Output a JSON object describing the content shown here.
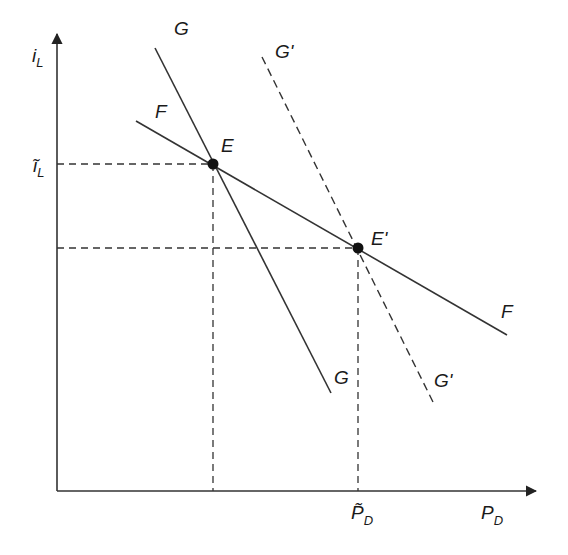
{
  "diagram": {
    "type": "economics-curve-diagram",
    "axes": {
      "y_label": "i",
      "y_label_sub": "L",
      "x_label": "P",
      "x_label_sub": "D",
      "y_tick_label": "ĩ",
      "y_tick_label_sub": "L",
      "x_tick_label": "P̃",
      "x_tick_label_sub": "D"
    },
    "curves": [
      {
        "id": "F",
        "label_start": "F",
        "label_end": "F",
        "style": "solid"
      },
      {
        "id": "G",
        "label_start": "G",
        "label_end": "G",
        "style": "solid"
      },
      {
        "id": "G_prime",
        "label_start": "G'",
        "label_end": "G'",
        "style": "dashed"
      }
    ],
    "points": [
      {
        "id": "E",
        "label": "E"
      },
      {
        "id": "E_prime",
        "label": "E'"
      }
    ],
    "colors": {
      "line": "#333333",
      "dot": "#111111",
      "text": "#1a1a1a"
    }
  }
}
